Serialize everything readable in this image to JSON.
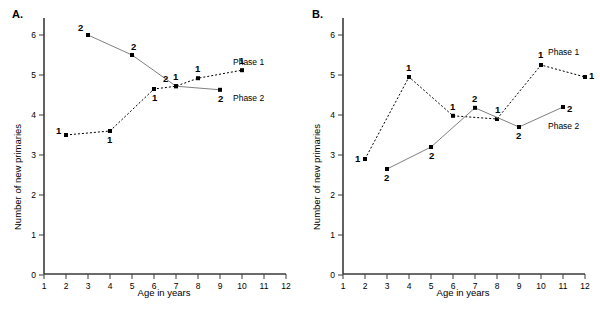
{
  "figure": {
    "background": "#ffffff",
    "axis_color": "#3a3a3a",
    "series1_color": "#000000",
    "series2_color": "#808080",
    "marker_color": "#000000"
  },
  "panels": [
    {
      "letter": "A.",
      "xlabel": "Age in years",
      "ylabel": "Number of new primaries",
      "xticks": [
        "1",
        "2",
        "3",
        "4",
        "5",
        "6",
        "7",
        "8",
        "9",
        "10",
        "11",
        "12"
      ],
      "yticks": [
        "0",
        "1",
        "2",
        "3",
        "4",
        "5",
        "6"
      ],
      "series_labels": {
        "phase1": "Phase 1",
        "phase2": "Phase 2"
      },
      "point_labels_phase1": [
        "1",
        "1",
        "1",
        "1",
        "1",
        "1"
      ],
      "point_labels_phase2": [
        "2",
        "2",
        "2",
        "2"
      ]
    },
    {
      "letter": "B.",
      "xlabel": "Age in years",
      "ylabel": "Number of new primaries",
      "xticks": [
        "1",
        "2",
        "3",
        "4",
        "5",
        "6",
        "7",
        "8",
        "9",
        "10",
        "11",
        "12"
      ],
      "yticks": [
        "0",
        "1",
        "2",
        "3",
        "4",
        "5",
        "6"
      ],
      "series_labels": {
        "phase1": "Phase 1",
        "phase2": "Phase 2"
      },
      "point_labels_phase1": [
        "1",
        "1",
        "1",
        "1",
        "1",
        "1"
      ],
      "point_labels_phase2": [
        "2",
        "2",
        "2",
        "2",
        "2"
      ]
    }
  ],
  "chart_data": [
    {
      "type": "line",
      "panel": "A.",
      "title": "",
      "xlabel": "Age in years",
      "ylabel": "Number of new primaries",
      "xlim": [
        1,
        12
      ],
      "ylim": [
        0,
        6.5
      ],
      "xticks": [
        1,
        2,
        3,
        4,
        5,
        6,
        7,
        8,
        9,
        10,
        11,
        12
      ],
      "yticks": [
        0,
        1,
        2,
        3,
        4,
        5,
        6
      ],
      "grid": false,
      "legend_position": "inline-right",
      "series": [
        {
          "name": "Phase 1",
          "marker_label": "1",
          "linestyle": "dashed",
          "color": "#000000",
          "x": [
            2,
            4,
            6,
            7,
            8,
            10
          ],
          "values": [
            3.5,
            3.6,
            4.65,
            4.72,
            4.92,
            5.12
          ]
        },
        {
          "name": "Phase 2",
          "marker_label": "2",
          "linestyle": "solid",
          "color": "#808080",
          "x": [
            3,
            5,
            7,
            9
          ],
          "values": [
            6.0,
            5.5,
            4.72,
            4.63
          ]
        }
      ]
    },
    {
      "type": "line",
      "panel": "B.",
      "title": "",
      "xlabel": "Age in years",
      "ylabel": "Number of new primaries",
      "xlim": [
        1,
        12
      ],
      "ylim": [
        0,
        6.5
      ],
      "xticks": [
        1,
        2,
        3,
        4,
        5,
        6,
        7,
        8,
        9,
        10,
        11,
        12
      ],
      "yticks": [
        0,
        1,
        2,
        3,
        4,
        5,
        6
      ],
      "grid": false,
      "legend_position": "inline-right",
      "series": [
        {
          "name": "Phase 1",
          "marker_label": "1",
          "linestyle": "dashed",
          "color": "#000000",
          "x": [
            2,
            4,
            6,
            8,
            10,
            12
          ],
          "values": [
            2.9,
            4.95,
            3.98,
            3.9,
            5.25,
            4.95
          ]
        },
        {
          "name": "Phase 2",
          "marker_label": "2",
          "linestyle": "solid",
          "color": "#808080",
          "x": [
            3,
            5,
            7,
            9,
            11
          ],
          "values": [
            2.65,
            3.2,
            4.18,
            3.7,
            4.2
          ]
        }
      ]
    }
  ]
}
